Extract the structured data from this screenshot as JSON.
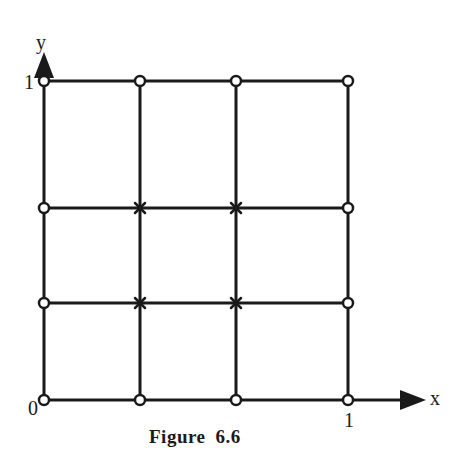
{
  "figure": {
    "caption_label": "Figure",
    "caption_number": "6.6",
    "axes": {
      "x_label": "x",
      "y_label": "y",
      "origin_label": "0",
      "x_max_label": "1",
      "y_max_label": "1"
    },
    "grid": {
      "divisions": 3,
      "boundary_node_marker": "open-circle",
      "interior_node_marker": "cross-star",
      "boundary_nodes_count": 12,
      "interior_nodes_count": 4
    },
    "colors": {
      "line": "#1a1a1a",
      "background": "#ffffff"
    }
  }
}
